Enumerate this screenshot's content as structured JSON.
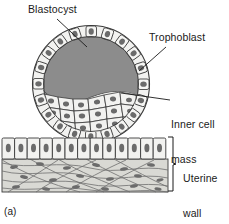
{
  "figure": {
    "panel_label": "(a)",
    "background_color": "#ffffff",
    "ink_color": "#1a1a1a"
  },
  "labels": {
    "blastocyst": "Blastocyst",
    "trophoblast": "Trophoblast",
    "inner_cell_mass_line1": "Inner cell",
    "inner_cell_mass_line2": "mass",
    "uterine_wall_line1": "Uterine",
    "uterine_wall_line2": "wall"
  },
  "colors": {
    "cavity_fill": "#8c8c8c",
    "cell_fill": "#f2f2f0",
    "nucleus_fill": "#6b6b6b",
    "connective_fill": "#d9d9d4",
    "outline": "#3a3a3a"
  },
  "structures": {
    "blastocyst_circle": {
      "cx": 91,
      "cy": 84,
      "r": 59
    },
    "blastocoel_cavity": "dark gray fluid-filled cavity occupying upper interior",
    "trophoblast_ring": "single ring of cuboidal cells forming the sphere wall",
    "inner_cell_mass": "cluster of polygonal cells filling lower interior",
    "uterine_epithelium": "row of columnar cells across lower figure",
    "uterine_connective_tissue": "wavy crisscrossing fibers with elongated nuclei",
    "uterine_wall_bracket": {
      "x": 172,
      "y_top": 137,
      "y_bottom": 191
    }
  },
  "leader_lines": {
    "blastocyst": "from text down-right into cavity",
    "trophoblast": "from text down-left to outer cell ring",
    "inner_cell_mass": "from text left to inner cell cluster"
  }
}
